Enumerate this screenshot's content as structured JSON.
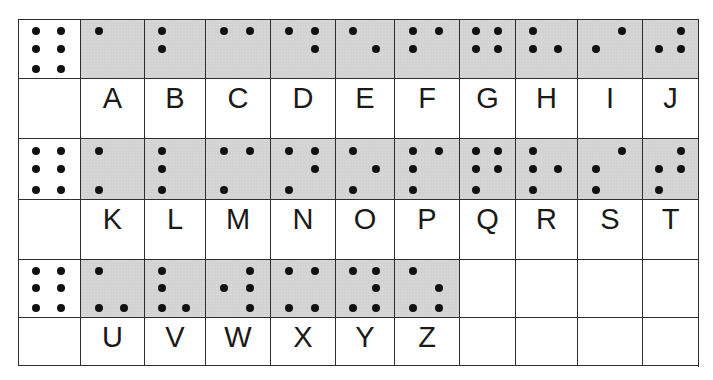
{
  "colors": {
    "braille_cell_bg": "#d3d3d3",
    "label_cell_bg": "#ffffff",
    "dot": "#111111",
    "grid_line": "#2e2e2e",
    "text": "#1a1a1a"
  },
  "grid": {
    "col_edges": [
      18,
      80,
      144,
      205,
      270,
      335,
      394,
      459,
      515,
      577,
      642,
      698
    ],
    "row_edges": [
      19,
      78,
      138,
      199,
      259,
      317,
      365
    ],
    "dot_cols_pct": [
      0.28,
      0.67
    ],
    "dot_rows_pct": [
      0.19,
      0.49,
      0.83
    ]
  },
  "dot_numbering": "1-2-3 left column top-to-bottom, 4-5-6 right column top-to-bottom",
  "key_cell": {
    "label": "full six-dot cell",
    "dots": [
      1,
      2,
      3,
      4,
      5,
      6
    ]
  },
  "rows": [
    {
      "key_dots": [
        1,
        2,
        3,
        4,
        5,
        6
      ],
      "letters": [
        {
          "letter": "A",
          "dots": [
            1
          ]
        },
        {
          "letter": "B",
          "dots": [
            1,
            2
          ]
        },
        {
          "letter": "C",
          "dots": [
            1,
            4
          ]
        },
        {
          "letter": "D",
          "dots": [
            1,
            4,
            5
          ]
        },
        {
          "letter": "E",
          "dots": [
            1,
            5
          ]
        },
        {
          "letter": "F",
          "dots": [
            1,
            2,
            4
          ]
        },
        {
          "letter": "G",
          "dots": [
            1,
            2,
            4,
            5
          ]
        },
        {
          "letter": "H",
          "dots": [
            1,
            2,
            5
          ]
        },
        {
          "letter": "I",
          "dots": [
            2,
            4
          ]
        },
        {
          "letter": "J",
          "dots": [
            2,
            4,
            5
          ]
        }
      ]
    },
    {
      "key_dots": [
        1,
        2,
        3,
        4,
        5,
        6
      ],
      "letters": [
        {
          "letter": "K",
          "dots": [
            1,
            3
          ]
        },
        {
          "letter": "L",
          "dots": [
            1,
            2,
            3
          ]
        },
        {
          "letter": "M",
          "dots": [
            1,
            3,
            4
          ]
        },
        {
          "letter": "N",
          "dots": [
            1,
            3,
            4,
            5
          ]
        },
        {
          "letter": "O",
          "dots": [
            1,
            3,
            5
          ]
        },
        {
          "letter": "P",
          "dots": [
            1,
            2,
            3,
            4
          ]
        },
        {
          "letter": "Q",
          "dots": [
            1,
            2,
            3,
            4,
            5
          ]
        },
        {
          "letter": "R",
          "dots": [
            1,
            2,
            3,
            5
          ]
        },
        {
          "letter": "S",
          "dots": [
            2,
            3,
            4
          ]
        },
        {
          "letter": "T",
          "dots": [
            2,
            3,
            4,
            5
          ]
        }
      ]
    },
    {
      "key_dots": [
        1,
        2,
        3,
        4,
        5,
        6
      ],
      "letters": [
        {
          "letter": "U",
          "dots": [
            1,
            3,
            6
          ]
        },
        {
          "letter": "V",
          "dots": [
            1,
            2,
            3,
            6
          ]
        },
        {
          "letter": "W",
          "dots": [
            2,
            4,
            5,
            6
          ]
        },
        {
          "letter": "X",
          "dots": [
            1,
            3,
            4,
            6
          ]
        },
        {
          "letter": "Y",
          "dots": [
            1,
            3,
            4,
            5,
            6
          ]
        },
        {
          "letter": "Z",
          "dots": [
            1,
            3,
            5,
            6
          ]
        },
        {
          "letter": "",
          "dots": []
        },
        {
          "letter": "",
          "dots": []
        },
        {
          "letter": "",
          "dots": []
        },
        {
          "letter": "",
          "dots": []
        }
      ]
    }
  ]
}
